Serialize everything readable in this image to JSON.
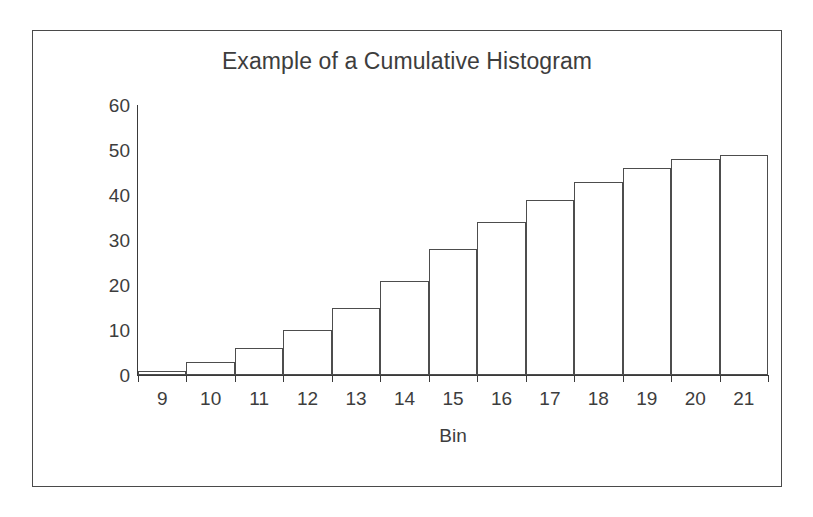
{
  "figure": {
    "background_color": "#ffffff",
    "border_color": "#4a4a4a",
    "axis_color": "#3a3a3a",
    "bar_outline_color": "#4d4d4d",
    "text_color": "#3d3d3d"
  },
  "chart_data": {
    "type": "bar",
    "title": "Example of a Cumulative Histogram",
    "xlabel": "Bin",
    "ylabel": "Cumulative Frequency",
    "categories": [
      "9",
      "10",
      "11",
      "12",
      "13",
      "14",
      "15",
      "16",
      "17",
      "18",
      "19",
      "20",
      "21"
    ],
    "values": [
      1,
      3,
      6,
      10,
      15,
      21,
      28,
      34,
      39,
      43,
      46,
      48,
      49
    ],
    "ylim": [
      0,
      60
    ],
    "ytick_labels": [
      "0",
      "10",
      "20",
      "30",
      "40",
      "50",
      "60"
    ],
    "ytick_values": [
      0,
      10,
      20,
      30,
      40,
      50,
      60
    ],
    "grid": false,
    "legend": false,
    "bar_fill": "none",
    "bar_gap": 0
  }
}
